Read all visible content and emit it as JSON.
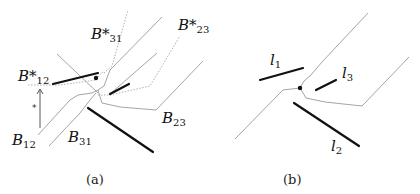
{
  "panel_a": {
    "caption": "(a)",
    "labels": {
      "b_star_31": {
        "main": "B*",
        "sub": "31"
      },
      "b_star_23": {
        "main": "B*",
        "sub": "23"
      },
      "b_star_12": {
        "main": "B*",
        "sub": "12"
      },
      "b_12": {
        "main": "B",
        "sub": "12"
      },
      "b_31": {
        "main": "B",
        "sub": "31"
      },
      "b_23": {
        "main": "B",
        "sub": "23"
      }
    },
    "arrow_label": "*"
  },
  "panel_b": {
    "caption": "(b)",
    "labels": {
      "l_1": {
        "main": "l",
        "sub": "1"
      },
      "l_2": {
        "main": "l",
        "sub": "2"
      },
      "l_3": {
        "main": "l",
        "sub": "3"
      }
    }
  },
  "colors": {
    "thin_line": "#9a9a9a",
    "thick_line": "#111111",
    "dotted_line": "#a8a8a8"
  }
}
